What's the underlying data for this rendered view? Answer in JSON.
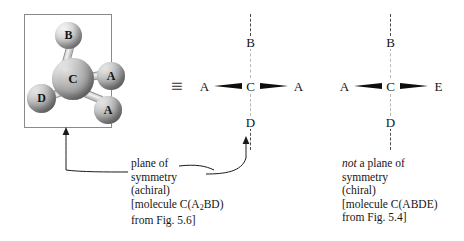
{
  "figure": {
    "identity_symbol": "≡"
  },
  "molecule_3d": {
    "center_atom": "C",
    "substituents": [
      {
        "label": "B",
        "position": "top"
      },
      {
        "label": "A",
        "position": "right-upper"
      },
      {
        "label": "A",
        "position": "right-lower"
      },
      {
        "label": "D",
        "position": "left-lower"
      }
    ]
  },
  "flat_left": {
    "top": "B",
    "center": "C",
    "bottom": "D",
    "left": "A",
    "right": "A"
  },
  "flat_right": {
    "top": "B",
    "center": "C",
    "bottom": "D",
    "left": "A",
    "right": "E"
  },
  "caption_left": {
    "line1": "plane of",
    "line2": "symmetry",
    "line3": "(achiral)",
    "line4_pre": "[molecule C(A",
    "line4_sub": "2",
    "line4_post": "BD)",
    "line5": "from Fig. 5.6]"
  },
  "caption_right": {
    "line1_em": "not",
    "line1_rest": " a plane of",
    "line2": "symmetry",
    "line3": "(chiral)",
    "line4": "[molecule C(ABDE)",
    "line5": "from Fig. 5.4]"
  },
  "colors": {
    "box_border": "#8a8a8a",
    "dash_line": "#4a4a4a",
    "wedge": "#0d0d0d",
    "arrow": "#1a1a1a",
    "text": "#161616"
  }
}
